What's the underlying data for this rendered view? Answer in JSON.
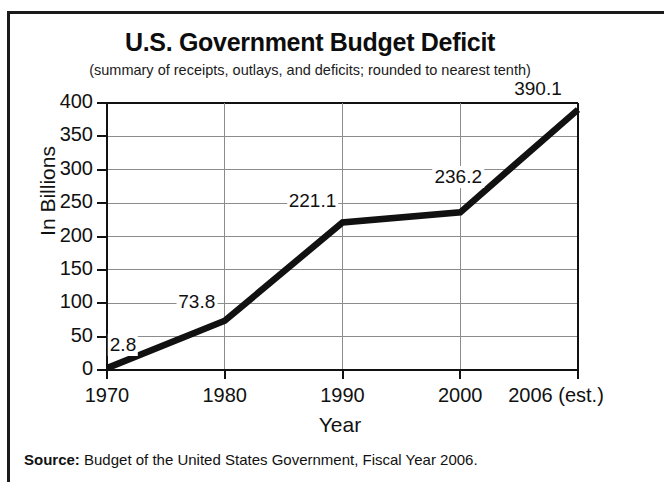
{
  "figure": {
    "title": "U.S. Government Budget Deficit",
    "subtitle": "(summary of receipts, outlays, and deficits; rounded to nearest tenth)",
    "source_prefix": "Source:",
    "source_text": " Budget of the United States Government, Fiscal Year 2006."
  },
  "chart_data": {
    "type": "line",
    "title": "U.S. Government Budget Deficit",
    "subtitle": "(summary of receipts, outlays, and deficits; rounded to nearest tenth)",
    "xlabel": "Year",
    "ylabel": "In Billions",
    "categories": [
      "1970",
      "1980",
      "1990",
      "2000",
      "2006 (est.)"
    ],
    "x": [
      1970,
      1980,
      1990,
      2000,
      2006
    ],
    "values": [
      2.8,
      73.8,
      221.1,
      236.2,
      390.1
    ],
    "point_labels": [
      "2.8",
      "73.8",
      "221.1",
      "236.2",
      "390.1"
    ],
    "ylim": [
      0,
      400
    ],
    "yticks": [
      0,
      50,
      100,
      150,
      200,
      250,
      300,
      350,
      400
    ],
    "ytick_labels": [
      "0",
      "50",
      "100",
      "150",
      "200",
      "250",
      "300",
      "350",
      "400"
    ],
    "xtick_labels": [
      "1970",
      "1980",
      "1990",
      "2000",
      "2006 (est.)"
    ],
    "grid": true,
    "grid_axis": "y",
    "legend": false,
    "line_color": "#111111",
    "grid_color": "#8c8c8c",
    "axis_color": "#111111",
    "background_color": "#ffffff"
  }
}
